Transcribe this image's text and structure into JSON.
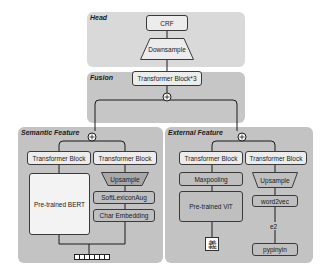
{
  "head": {
    "title": "Head",
    "crf": "CRF",
    "downsample": "Downsample"
  },
  "fusion": {
    "title": "Fusion",
    "transformer": "Transformer Block*3"
  },
  "semantic": {
    "title": "Semantic Feature",
    "left_transformer": "Transformer Block",
    "right_transformer": "Transformer Block",
    "bert": "Pre-trained BERT",
    "upsample": "Upsample",
    "softlexicon": "SoftLexiconAug",
    "char_embedding": "Char Embedding",
    "token_count": 7
  },
  "external": {
    "title": "External Feature",
    "left_transformer": "Transformer Block",
    "right_transformer": "Transformer Block",
    "maxpooling": "Maxpooling",
    "vit": "Pre-trained ViT",
    "glyph_char": "義",
    "upsample": "Upsample",
    "word2vec": "word2vec",
    "e2": "e2",
    "pypinyin": "pypinyin"
  },
  "colors": {
    "head_bg": "#d9d9d9",
    "fusion_bg": "#c6c6c6",
    "feature_bg": "#c3c3c3",
    "line": "#1a1a1a"
  }
}
